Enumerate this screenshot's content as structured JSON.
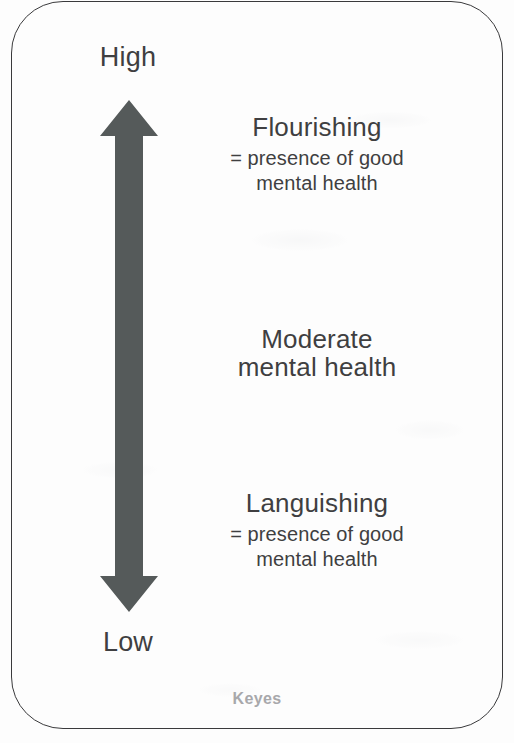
{
  "diagram": {
    "axis": {
      "top_label": "High",
      "bottom_label": "Low",
      "arrow_icon": "double-headed-vertical-arrow",
      "arrow_color": "#555a5a"
    },
    "states": [
      {
        "id": "flourishing",
        "title": "Flourishing",
        "subtitle_line1": "= presence of good",
        "subtitle_line2": "mental health"
      },
      {
        "id": "moderate",
        "title_line1": "Moderate",
        "title_line2": "mental health"
      },
      {
        "id": "languishing",
        "title": "Languishing",
        "subtitle_line1": "= presence of good",
        "subtitle_line2": "mental health"
      }
    ],
    "attribution": "Keyes",
    "frame_border_color": "#3a3a3c",
    "text_color": "#3f3f41",
    "attribution_color": "#a8a8ab"
  }
}
